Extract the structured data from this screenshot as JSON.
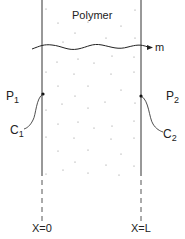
{
  "title": "Polymer",
  "flux_label": "m",
  "left": {
    "pressure": "P",
    "pressure_sub": "1",
    "conc": "C",
    "conc_sub": "1",
    "position": "X=0"
  },
  "right": {
    "pressure": "P",
    "pressure_sub": "2",
    "conc": "C",
    "conc_sub": "2",
    "position": "X=L"
  },
  "colors": {
    "ink": "#222222",
    "dots": "#888888",
    "background": "#ffffff"
  }
}
